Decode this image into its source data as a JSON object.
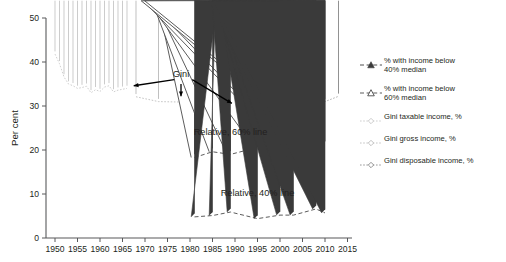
{
  "chart_data": {
    "type": "line",
    "title": "",
    "xlabel": "",
    "ylabel": "Per cent",
    "xlim": [
      1948,
      2016
    ],
    "ylim": [
      0,
      50
    ],
    "xticks": [
      1950,
      1955,
      1960,
      1965,
      1970,
      1975,
      1980,
      1985,
      1990,
      1995,
      2000,
      2005,
      2010,
      2015
    ],
    "yticks": [
      0,
      10,
      20,
      30,
      40,
      50
    ],
    "grid": false,
    "legend_position": "right",
    "annotations": [
      {
        "text": "Gini",
        "x": 1978,
        "y": 36.5
      },
      {
        "text": "Relative, 60% line",
        "x": 1989,
        "y": 23.5
      },
      {
        "text": "Relative, 40% line",
        "x": 1995,
        "y": 9.5
      }
    ],
    "series": [
      {
        "name": "Gini taxable income, %",
        "marker": "open-diamond",
        "color": "#c9c9c9",
        "points": [
          [
            1950,
            41.8
          ],
          [
            1951,
            39.6
          ],
          [
            1952,
            36.6
          ],
          [
            1953,
            35.0
          ],
          [
            1954,
            34.6
          ],
          [
            1955,
            34.0
          ],
          [
            1956,
            34.2
          ],
          [
            1957,
            34.5
          ],
          [
            1958,
            33.0
          ],
          [
            1959,
            33.7
          ],
          [
            1960,
            33.3
          ],
          [
            1961,
            34.3
          ],
          [
            1962,
            34.6
          ],
          [
            1963,
            33.2
          ],
          [
            1964,
            33.6
          ],
          [
            1965,
            33.8
          ],
          [
            1966,
            34.0
          ]
        ]
      },
      {
        "name": "Gini gross income, %",
        "marker": "open-diamond",
        "color": "#bdbdbd",
        "points": [
          [
            1968,
            32.1
          ],
          [
            1973,
            31.0
          ],
          [
            1978,
            30.9
          ]
        ]
      },
      {
        "name": "Gini disposable income, %",
        "marker": "open-diamond",
        "color": "#8c8c8c",
        "points": [
          [
            1981,
            27.1
          ],
          [
            1985,
            28.1
          ],
          [
            1989,
            29.3
          ],
          [
            1994,
            30.1
          ],
          [
            1995,
            29.8
          ],
          [
            1996,
            29.3
          ],
          [
            1997,
            30.3
          ],
          [
            1998,
            30.8
          ],
          [
            1999,
            31.0
          ],
          [
            2000,
            31.1
          ],
          [
            2001,
            30.8
          ],
          [
            2002,
            30.7
          ],
          [
            2003,
            30.6
          ],
          [
            2005,
            31.4
          ],
          [
            2007,
            32.4
          ],
          [
            2008,
            31.9
          ],
          [
            2010,
            31.0
          ],
          [
            2013,
            32.2
          ]
        ]
      },
      {
        "name": "% with income below 60% median",
        "marker": "open-triangle",
        "color": "#4a4a4a",
        "points": [
          [
            1981,
            18.3
          ],
          [
            1985,
            19.6
          ],
          [
            1989,
            19.0
          ],
          [
            1995,
            20.6
          ],
          [
            2001,
            21.5
          ],
          [
            2003,
            20.3
          ],
          [
            2008,
            22.0
          ],
          [
            2010,
            21.2
          ]
        ]
      },
      {
        "name": "% with income below 40% median",
        "marker": "filled-triangle",
        "color": "#3a3a3a",
        "points": [
          [
            1981,
            4.8
          ],
          [
            1985,
            5.1
          ],
          [
            1989,
            5.9
          ],
          [
            1995,
            4.4
          ],
          [
            2000,
            5.2
          ],
          [
            2003,
            5.2
          ],
          [
            2008,
            6.6
          ],
          [
            2010,
            5.7
          ]
        ]
      }
    ]
  },
  "legend": {
    "items": [
      {
        "label": "% with income below\n40% median",
        "marker": "filled-triangle",
        "color": "#3a3a3a"
      },
      {
        "label": "% with income below\n60% median",
        "marker": "open-triangle",
        "color": "#4a4a4a"
      },
      {
        "label": "Gini taxable income, %",
        "marker": "open-diamond",
        "color": "#c9c9c9"
      },
      {
        "label": "Gini gross income, %",
        "marker": "open-diamond",
        "color": "#bdbdbd"
      },
      {
        "label": "Gini disposable income, %",
        "marker": "open-diamond",
        "color": "#8c8c8c"
      }
    ]
  }
}
